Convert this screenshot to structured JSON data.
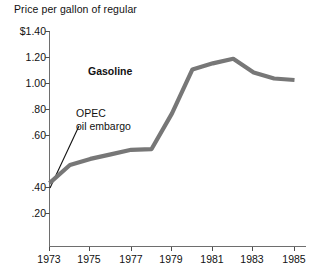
{
  "chart_data": {
    "type": "line",
    "title": "Price per gallon of regular",
    "xlabel": "",
    "ylabel": "",
    "grid": false,
    "legend_position": "inline-label",
    "xlim": [
      1973,
      1985
    ],
    "ylim": [
      0,
      1.4
    ],
    "x": [
      1973,
      1974,
      1975,
      1976,
      1977,
      1978,
      1979,
      1980,
      1981,
      1982,
      1983,
      1984,
      1985
    ],
    "xtick_labels": [
      "1973",
      "1975",
      "1977",
      "1979",
      "1981",
      "1983",
      "1985"
    ],
    "xticks": [
      1973,
      1975,
      1977,
      1979,
      1981,
      1983,
      1985
    ],
    "ytick_labels": [
      "$1.40",
      "1.20",
      "1.00",
      ".80",
      ".60",
      ".40",
      ".20"
    ],
    "yticks": [
      1.4,
      1.2,
      1.0,
      0.8,
      0.6,
      0.4,
      0.2
    ],
    "series": [
      {
        "name": "Gasoline",
        "color": "#777777",
        "values": [
          0.4,
          0.52,
          0.56,
          0.59,
          0.62,
          0.625,
          0.86,
          1.15,
          1.19,
          1.22,
          1.13,
          1.09,
          1.08
        ]
      }
    ],
    "annotations": [
      {
        "name": "opec-oil-embargo",
        "line1": "OPEC",
        "line2": "oil embargo",
        "points_to_x": 1973,
        "points_to_y": 0.4
      }
    ]
  },
  "axis": {
    "tick_color": "#4d4d4d",
    "line_color": "#6e6e6e"
  },
  "labels": {
    "title": "Price per gallon of regular",
    "series_label": "Gasoline",
    "annotation_line1": "OPEC",
    "annotation_line2": "oil embargo",
    "y0": "$1.40",
    "y1": "1.20",
    "y2": "1.00",
    "y3": ".80",
    "y4": ".60",
    "y5": ".40",
    "y6": ".20",
    "x0": "1973",
    "x1": "1975",
    "x2": "1977",
    "x3": "1979",
    "x4": "1981",
    "x5": "1983",
    "x6": "1985"
  }
}
